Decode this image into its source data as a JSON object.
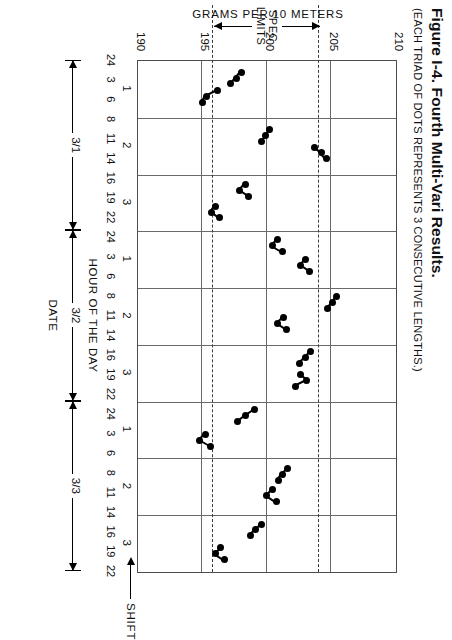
{
  "figure": {
    "title": "Figure I-4.  Fourth Multi-Vari Results.",
    "subtitle": "(EACH TRIAD OF DOTS REPRESENTS 3 CONSECUTIVE LENGTHS.)"
  },
  "annotations": {
    "spec_limits": "SPEC\nLIMITS",
    "spec_limits_line1": "SPEC",
    "spec_limits_line2": "LIMITS",
    "shift": "SHIFT"
  },
  "axes": {
    "y_label": "GRAMS PER 10 METERS",
    "y_ticks": [
      210,
      205,
      200,
      195,
      190
    ],
    "y_min": 190,
    "y_max": 210,
    "x_label_hour": "HOUR OF THE DAY",
    "x_label_date": "DATE",
    "shift_labels": [
      "1",
      "2",
      "3",
      "1",
      "2",
      "3",
      "1",
      "2",
      "3"
    ],
    "hour_labels": [
      "24",
      "3",
      "6",
      "8",
      "11",
      "14",
      "16",
      "19",
      "22",
      "24",
      "3",
      "6",
      "8",
      "11",
      "14",
      "16",
      "19",
      "22",
      "24",
      "3",
      "6",
      "8",
      "11",
      "14",
      "16",
      "19",
      "22"
    ],
    "dates": [
      "3/1",
      "3/2",
      "3/3"
    ]
  },
  "chart_data": {
    "type": "scatter",
    "title": "Fourth Multi-Vari Results.",
    "subtitle": "(EACH TRIAD OF DOTS REPRESENTS 3 CONSECUTIVE LENGTHS.)",
    "xlabel": "HOUR OF THE DAY / DATE",
    "ylabel": "GRAMS PER 10 METERS",
    "ylim": [
      190,
      210
    ],
    "yticks": [
      190,
      195,
      200,
      205,
      210
    ],
    "grid": true,
    "legend": "none",
    "spec_limits": [
      195.8,
      204.0
    ],
    "shift_boundaries": [
      "1",
      "2",
      "3",
      "1",
      "2",
      "3",
      "1",
      "2",
      "3"
    ],
    "note": "x = sequential sample position across 9 shifts over 3 days; y = grams per 10 meters. Each triad = 3 consecutive lengths joined by a line.",
    "triads": [
      {
        "shift": 1,
        "date": "3/1",
        "hour": 3,
        "x": 0.3,
        "values": [
          198.0,
          197.6,
          197.2
        ]
      },
      {
        "shift": 1,
        "date": "3/1",
        "hour": 6,
        "x": 0.62,
        "values": [
          196.2,
          195.3,
          195.0
        ]
      },
      {
        "shift": 2,
        "date": "3/1",
        "hour": 11,
        "x": 1.32,
        "values": [
          200.2,
          199.9,
          199.6
        ]
      },
      {
        "shift": 2,
        "date": "3/1",
        "hour": 14,
        "x": 1.62,
        "values": [
          203.7,
          204.2,
          204.6
        ]
      },
      {
        "shift": 3,
        "date": "3/1",
        "hour": 19,
        "x": 2.28,
        "values": [
          198.3,
          197.9,
          198.6
        ]
      },
      {
        "shift": 3,
        "date": "3/1",
        "hour": 22,
        "x": 2.66,
        "values": [
          196.0,
          195.7,
          196.3
        ]
      },
      {
        "shift": 1,
        "date": "3/2",
        "hour": 3,
        "x": 3.25,
        "values": [
          200.8,
          200.4,
          201.2
        ]
      },
      {
        "shift": 1,
        "date": "3/2",
        "hour": 6,
        "x": 3.6,
        "values": [
          203.0,
          202.6,
          203.3
        ]
      },
      {
        "shift": 2,
        "date": "3/2",
        "hour": 11,
        "x": 4.25,
        "values": [
          205.4,
          205.1,
          204.7
        ]
      },
      {
        "shift": 2,
        "date": "3/2",
        "hour": 14,
        "x": 4.62,
        "values": [
          201.3,
          200.8,
          201.5
        ]
      },
      {
        "shift": 3,
        "date": "3/2",
        "hour": 19,
        "x": 5.22,
        "values": [
          203.4,
          203.0,
          202.5
        ]
      },
      {
        "shift": 3,
        "date": "3/2",
        "hour": 22,
        "x": 5.62,
        "values": [
          202.6,
          203.1,
          202.2
        ]
      },
      {
        "shift": 1,
        "date": "3/3",
        "hour": 3,
        "x": 6.25,
        "values": [
          199.0,
          198.3,
          197.7
        ]
      },
      {
        "shift": 1,
        "date": "3/3",
        "hour": 6,
        "x": 6.68,
        "values": [
          195.2,
          194.8,
          195.6
        ]
      },
      {
        "shift": 2,
        "date": "3/3",
        "hour": 11,
        "x": 7.28,
        "values": [
          201.6,
          201.2,
          200.9
        ]
      },
      {
        "shift": 2,
        "date": "3/3",
        "hour": 14,
        "x": 7.66,
        "values": [
          200.4,
          200.0,
          200.7
        ]
      },
      {
        "shift": 3,
        "date": "3/3",
        "hour": 19,
        "x": 8.26,
        "values": [
          199.6,
          199.1,
          198.7
        ]
      },
      {
        "shift": 3,
        "date": "3/3",
        "hour": 22,
        "x": 8.68,
        "values": [
          196.4,
          196.0,
          196.7
        ]
      }
    ],
    "points": [
      {
        "x": 0.1,
        "y": 205.1
      },
      {
        "x": 0.16,
        "y": 204.2
      },
      {
        "x": 0.22,
        "y": 204.9
      },
      {
        "x": 0.62,
        "y": 200.8
      },
      {
        "x": 0.7,
        "y": 200.2
      },
      {
        "x": 0.8,
        "y": 200.6
      },
      {
        "x": 1.1,
        "y": 199.2
      },
      {
        "x": 1.18,
        "y": 198.6
      },
      {
        "x": 1.28,
        "y": 199.0
      },
      {
        "x": 1.55,
        "y": 203.9
      },
      {
        "x": 1.62,
        "y": 204.4
      },
      {
        "x": 1.72,
        "y": 204.0
      },
      {
        "x": 2.2,
        "y": 198.4
      },
      {
        "x": 2.3,
        "y": 197.8
      },
      {
        "x": 2.4,
        "y": 198.2
      },
      {
        "x": 2.7,
        "y": 196.2
      },
      {
        "x": 2.8,
        "y": 195.6
      },
      {
        "x": 2.88,
        "y": 196.0
      },
      {
        "x": 3.3,
        "y": 202.0
      },
      {
        "x": 3.42,
        "y": 201.4
      },
      {
        "x": 3.52,
        "y": 201.8
      },
      {
        "x": 3.9,
        "y": 205.6
      },
      {
        "x": 4.0,
        "y": 205.0
      },
      {
        "x": 4.1,
        "y": 205.4
      },
      {
        "x": 4.4,
        "y": 200.4
      },
      {
        "x": 4.52,
        "y": 199.8
      },
      {
        "x": 4.62,
        "y": 200.2
      },
      {
        "x": 5.05,
        "y": 197.0
      },
      {
        "x": 5.15,
        "y": 196.4
      },
      {
        "x": 5.25,
        "y": 196.8
      },
      {
        "x": 5.6,
        "y": 203.2
      },
      {
        "x": 5.7,
        "y": 202.6
      },
      {
        "x": 5.8,
        "y": 203.0
      },
      {
        "x": 6.1,
        "y": 199.6
      },
      {
        "x": 6.2,
        "y": 199.0
      },
      {
        "x": 6.3,
        "y": 199.4
      },
      {
        "x": 6.7,
        "y": 195.8
      },
      {
        "x": 6.8,
        "y": 195.2
      },
      {
        "x": 6.9,
        "y": 195.6
      },
      {
        "x": 7.2,
        "y": 201.2
      },
      {
        "x": 7.32,
        "y": 200.6
      },
      {
        "x": 7.42,
        "y": 201.0
      },
      {
        "x": 7.8,
        "y": 204.6
      },
      {
        "x": 7.9,
        "y": 204.0
      },
      {
        "x": 8.0,
        "y": 204.4
      },
      {
        "x": 8.3,
        "y": 198.8
      },
      {
        "x": 8.4,
        "y": 198.2
      },
      {
        "x": 8.5,
        "y": 198.6
      },
      {
        "x": 8.75,
        "y": 196.6
      },
      {
        "x": 8.85,
        "y": 196.0
      },
      {
        "x": 8.92,
        "y": 196.4
      }
    ]
  },
  "colors": {
    "ink": "#000000",
    "grid": "#6a6a6a",
    "frame": "#4c4c4c",
    "paper": "#ffffff"
  }
}
